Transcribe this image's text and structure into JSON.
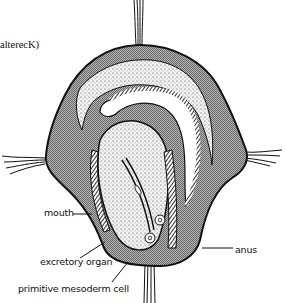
{
  "figure": {
    "caption_fragment": "alterecK)",
    "labels": {
      "mouth": "mouth",
      "excretory_organ": "excretory organ",
      "primitive_mesoderm_cell": "primitive mesoderm cell",
      "anus": "anus"
    },
    "colors": {
      "outline": "#111111",
      "shaded_tissue": "#9a9a9a",
      "stippled_tissue": "#d8d8d8",
      "background": "#ffffff"
    }
  }
}
